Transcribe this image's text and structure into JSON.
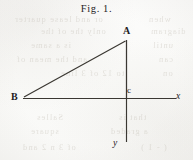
{
  "figure": {
    "caption": "Fig. 1.",
    "background_color": "#fbfbfa",
    "ink_color": "#3a3732",
    "label_color": "#23211e"
  },
  "geometry": {
    "description": "right triangle with coordinate axes",
    "points": {
      "A": {
        "label": "A",
        "x": 125,
        "y": 40
      },
      "B": {
        "label": "B",
        "x": 24,
        "y": 98
      },
      "c": {
        "label": "c",
        "x": 126,
        "y": 98
      }
    },
    "axes": {
      "x_axis": {
        "label": "x",
        "x1": 23,
        "y1": 98,
        "x2": 176,
        "y2": 98
      },
      "y_axis": {
        "label": "y",
        "x1": 126,
        "y1": 40,
        "x2": 126,
        "y2": 142
      }
    },
    "segments": [
      {
        "name": "hypotenuse-BA",
        "x1": 24,
        "y1": 97,
        "x2": 125,
        "y2": 41
      },
      {
        "name": "vertical-Ac",
        "x1": 126,
        "y1": 40,
        "x2": 126,
        "y2": 98
      },
      {
        "name": "base-Bc",
        "x1": 24,
        "y1": 98,
        "x2": 126,
        "y2": 98
      }
    ]
  },
  "labels": {
    "apex": "A",
    "left_vertex": "B",
    "origin": "c",
    "x_axis": "x",
    "y_axis": "y"
  },
  "ghost_text": [
    {
      "text": "or and lease quarter",
      "x": 14,
      "y": 18
    },
    {
      "text": "when",
      "x": 148,
      "y": 18
    },
    {
      "text": "only the of the",
      "x": 40,
      "y": 30
    },
    {
      "text": "diagram",
      "x": 150,
      "y": 30
    },
    {
      "text": "is a same",
      "x": 30,
      "y": 44
    },
    {
      "text": "until",
      "x": 152,
      "y": 44
    },
    {
      "text": "and the mean of",
      "x": 16,
      "y": 58
    },
    {
      "text": "can",
      "x": 158,
      "y": 58
    },
    {
      "text": "to 12 of 3 line",
      "x": 60,
      "y": 72
    },
    {
      "text": "on",
      "x": 162,
      "y": 72
    },
    {
      "text": "Salles",
      "x": 36,
      "y": 116
    },
    {
      "text": "that is",
      "x": 118,
      "y": 116
    },
    {
      "text": "square",
      "x": 30,
      "y": 130
    },
    {
      "text": "a graded",
      "x": 110,
      "y": 130
    },
    {
      "text": "of 3 n 2 and",
      "x": 22,
      "y": 146
    },
    {
      "text": "( - 1 )",
      "x": 140,
      "y": 146
    }
  ]
}
